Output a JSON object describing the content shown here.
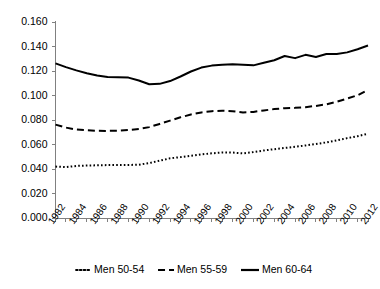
{
  "chart_data": {
    "type": "line",
    "title": "",
    "xlabel": "",
    "ylabel": "",
    "ylim": [
      0.0,
      0.16
    ],
    "ytick_step": 0.02,
    "ytick_labels": [
      "0.000",
      "0.020",
      "0.040",
      "0.060",
      "0.080",
      "0.100",
      "0.120",
      "0.140",
      "0.160"
    ],
    "ytick_values": [
      0.0,
      0.02,
      0.04,
      0.06,
      0.08,
      0.1,
      0.12,
      0.14,
      0.16
    ],
    "grid": false,
    "legend_position": "bottom",
    "x": [
      1982,
      1983,
      1984,
      1985,
      1986,
      1987,
      1988,
      1989,
      1990,
      1991,
      1992,
      1993,
      1994,
      1995,
      1996,
      1997,
      1998,
      1999,
      2000,
      2001,
      2002,
      2003,
      2004,
      2005,
      2006,
      2007,
      2008,
      2009,
      2010,
      2011,
      2012
    ],
    "xtick_labels": [
      "1982",
      "1984",
      "1986",
      "1988",
      "1990",
      "1992",
      "1994",
      "1996",
      "1998",
      "2000",
      "2002",
      "2004",
      "2006",
      "2008",
      "2010",
      "2012"
    ],
    "xtick_label_values": [
      1982,
      1984,
      1986,
      1988,
      1990,
      1992,
      1994,
      1996,
      1998,
      2000,
      2002,
      2004,
      2006,
      2008,
      2010,
      2012
    ],
    "xlim": [
      1982,
      2012
    ],
    "series": [
      {
        "name": "Men 50-54",
        "style": "dotted",
        "color": "#000000",
        "values": [
          0.042,
          0.0415,
          0.0425,
          0.0428,
          0.043,
          0.0432,
          0.0432,
          0.0433,
          0.0435,
          0.0448,
          0.0468,
          0.0487,
          0.0497,
          0.0508,
          0.0519,
          0.0528,
          0.0535,
          0.0534,
          0.0528,
          0.0538,
          0.0551,
          0.0562,
          0.0572,
          0.0581,
          0.0592,
          0.0604,
          0.0617,
          0.0634,
          0.0652,
          0.0668,
          0.0688
        ]
      },
      {
        "name": "Men 55-59",
        "style": "dashed",
        "color": "#000000",
        "values": [
          0.0762,
          0.0738,
          0.0722,
          0.0716,
          0.0712,
          0.0711,
          0.0712,
          0.0718,
          0.0726,
          0.0742,
          0.0768,
          0.0795,
          0.0822,
          0.0845,
          0.0862,
          0.0872,
          0.0876,
          0.0872,
          0.0862,
          0.0866,
          0.0878,
          0.0889,
          0.0896,
          0.0899,
          0.0905,
          0.0915,
          0.0928,
          0.0949,
          0.0975,
          0.1002,
          0.1046
        ]
      },
      {
        "name": "Men 60-64",
        "style": "solid",
        "color": "#000000",
        "values": [
          0.1262,
          0.1232,
          0.1205,
          0.1182,
          0.1164,
          0.1151,
          0.1148,
          0.1146,
          0.1122,
          0.1092,
          0.1095,
          0.1118,
          0.1155,
          0.1196,
          0.1228,
          0.1244,
          0.1252,
          0.1256,
          0.1252,
          0.1246,
          0.1268,
          0.1288,
          0.1322,
          0.1305,
          0.1332,
          0.1315,
          0.1338,
          0.1338,
          0.1352,
          0.1378,
          0.1408
        ]
      }
    ]
  },
  "legend": {
    "items": [
      {
        "label": "Men 50-54",
        "style": "dotted"
      },
      {
        "label": "Men 55-59",
        "style": "dashed"
      },
      {
        "label": "Men 60-64",
        "style": "solid"
      }
    ]
  }
}
